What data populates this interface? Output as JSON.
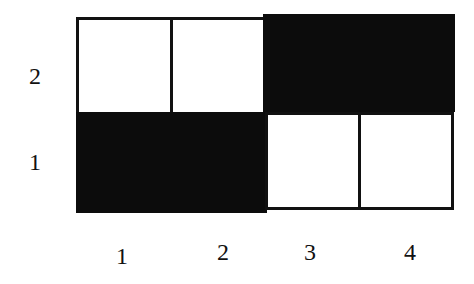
{
  "diagram": {
    "type": "grid",
    "rows": 2,
    "columns": 4,
    "row_labels": [
      "2",
      "1"
    ],
    "column_labels": [
      "1",
      "2",
      "3",
      "4"
    ],
    "colors": {
      "filled": "#0c0c0c",
      "empty": "#ffffff",
      "border": "#111111"
    },
    "cells": [
      {
        "row": "2",
        "col": "1",
        "fill": "white"
      },
      {
        "row": "2",
        "col": "2",
        "fill": "white"
      },
      {
        "row": "2",
        "col": "3",
        "fill": "black"
      },
      {
        "row": "2",
        "col": "4",
        "fill": "black"
      },
      {
        "row": "1",
        "col": "1",
        "fill": "black"
      },
      {
        "row": "1",
        "col": "2",
        "fill": "black"
      },
      {
        "row": "1",
        "col": "3",
        "fill": "white"
      },
      {
        "row": "1",
        "col": "4",
        "fill": "white"
      }
    ]
  }
}
